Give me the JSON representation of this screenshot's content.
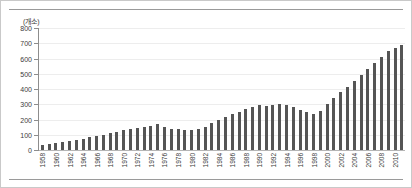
{
  "chart_data": {
    "type": "bar",
    "title": "",
    "subtitle": "",
    "unit_label": "(개소)",
    "xlabel": "",
    "ylabel": "",
    "ylim": [
      0,
      800
    ],
    "ytick_step": 100,
    "yticks": [
      0,
      100,
      200,
      300,
      400,
      500,
      600,
      700,
      800
    ],
    "ytick_labels": [
      "0",
      "100",
      "200",
      "300",
      "400",
      "500",
      "600",
      "700",
      "800"
    ],
    "grid": true,
    "legend": false,
    "legend_position": "none",
    "bar_color": "#555555",
    "gridline_color": "#ededed",
    "axis_color": "#8d8d8d",
    "xtick_label_interval": 2,
    "xtick_label_rotation": -90,
    "categories": [
      "1958",
      "1959",
      "1960",
      "1961",
      "1962",
      "1963",
      "1964",
      "1965",
      "1966",
      "1967",
      "1968",
      "1969",
      "1970",
      "1971",
      "1972",
      "1973",
      "1974",
      "1975",
      "1976",
      "1977",
      "1978",
      "1979",
      "1980",
      "1981",
      "1982",
      "1983",
      "1984",
      "1985",
      "1986",
      "1987",
      "1988",
      "1989",
      "1990",
      "1991",
      "1992",
      "1993",
      "1994",
      "1995",
      "1996",
      "1997",
      "1998",
      "1999",
      "2000",
      "2001",
      "2002",
      "2003",
      "2004",
      "2005",
      "2006",
      "2007",
      "2008",
      "2009",
      "2010",
      "2011"
    ],
    "xtick_labels": [
      "1958",
      "",
      "1960",
      "",
      "1962",
      "",
      "1964",
      "",
      "1966",
      "",
      "1968",
      "",
      "1970",
      "",
      "1972",
      "",
      "1974",
      "",
      "1976",
      "",
      "1978",
      "",
      "1980",
      "",
      "1982",
      "",
      "1984",
      "",
      "1986",
      "",
      "1988",
      "",
      "1990",
      "",
      "1992",
      "",
      "1994",
      "",
      "1996",
      "",
      "1998",
      "",
      "2000",
      "",
      "2002",
      "",
      "2004",
      "",
      "2006",
      "",
      "2008",
      "",
      "2010",
      ""
    ],
    "values": [
      35,
      40,
      48,
      55,
      60,
      68,
      75,
      85,
      92,
      100,
      110,
      120,
      130,
      138,
      145,
      152,
      160,
      168,
      150,
      140,
      135,
      130,
      128,
      135,
      150,
      175,
      195,
      215,
      235,
      250,
      268,
      282,
      292,
      288,
      296,
      300,
      292,
      282,
      265,
      250,
      238,
      258,
      300,
      340,
      378,
      415,
      455,
      495,
      530,
      570,
      610,
      650,
      672,
      688
    ]
  }
}
